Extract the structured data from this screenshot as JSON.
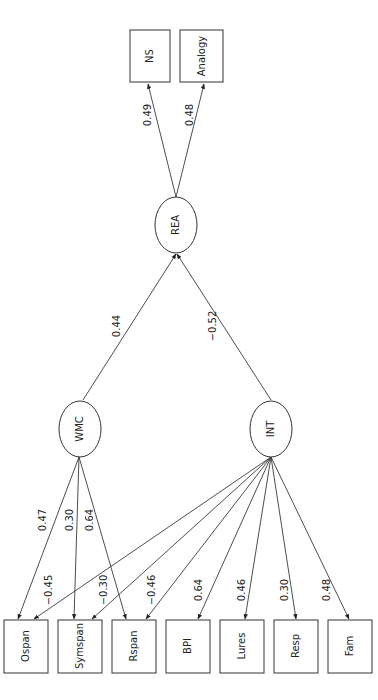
{
  "diagram": {
    "type": "structural-equation-model",
    "orientation": "rotated-90-ccw",
    "latent": {
      "wmc": {
        "label": "WMC"
      },
      "int": {
        "label": "INT"
      },
      "rea": {
        "label": "REA"
      }
    },
    "observed": {
      "ns": {
        "label": "NS"
      },
      "analogy": {
        "label": "Analogy"
      },
      "ospan": {
        "label": "Ospan"
      },
      "symspan": {
        "label": "Symspan"
      },
      "rspan": {
        "label": "Rspan"
      },
      "bpi": {
        "label": "BPI"
      },
      "lures": {
        "label": "Lures"
      },
      "resp": {
        "label": "Resp"
      },
      "fam": {
        "label": "Fam"
      }
    },
    "paths": {
      "wmc_rea": "0.44",
      "int_rea": "−0.52",
      "rea_ns": "0.49",
      "rea_analogy": "0.48",
      "wmc_ospan": "0.47",
      "wmc_symspan": "0.30",
      "wmc_rspan": "0.64",
      "int_ospan": "−0.45",
      "int_symspan": "−0.30",
      "int_rspan": "−0.46",
      "int_bpi": "0.64",
      "int_lures": "0.46",
      "int_resp": "0.30",
      "int_fam": "0.48"
    }
  }
}
